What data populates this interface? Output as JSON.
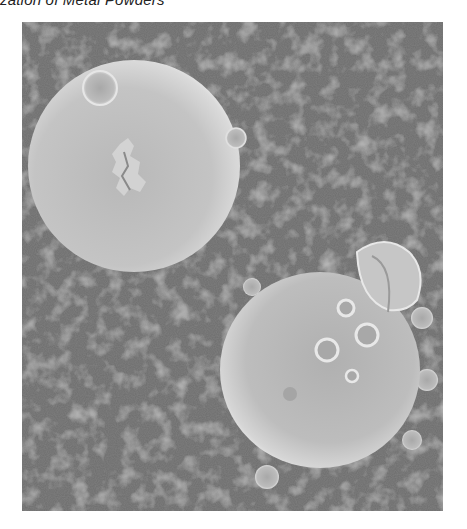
{
  "caption": {
    "text": "zation of Metal Powders"
  },
  "figure": {
    "type": "SEM micrograph",
    "background_color": "#6f6f6f",
    "particle_color": "#c8c8c8",
    "particles": [
      {
        "name": "large-sphere-upper-left",
        "cx": 112,
        "cy": 144,
        "r": 106,
        "satellites": [
          {
            "cx": 78,
            "cy": 66,
            "r": 17
          },
          {
            "cx": 214,
            "cy": 116,
            "r": 10
          }
        ],
        "surface_feature": "rough debris patch at center"
      },
      {
        "name": "sphere-lower-right",
        "cx": 298,
        "cy": 348,
        "r": 100,
        "satellites": [
          {
            "cx": 363,
            "cy": 253,
            "r": 36
          },
          {
            "cx": 230,
            "cy": 265,
            "r": 9
          },
          {
            "cx": 400,
            "cy": 296,
            "r": 11
          },
          {
            "cx": 405,
            "cy": 358,
            "r": 11
          },
          {
            "cx": 390,
            "cy": 418,
            "r": 10
          },
          {
            "cx": 245,
            "cy": 455,
            "r": 12
          },
          {
            "cx": 305,
            "cy": 328,
            "r": 11
          },
          {
            "cx": 345,
            "cy": 313,
            "r": 11
          },
          {
            "cx": 324,
            "cy": 286,
            "r": 8
          },
          {
            "cx": 330,
            "cy": 354,
            "r": 6
          }
        ]
      }
    ]
  }
}
